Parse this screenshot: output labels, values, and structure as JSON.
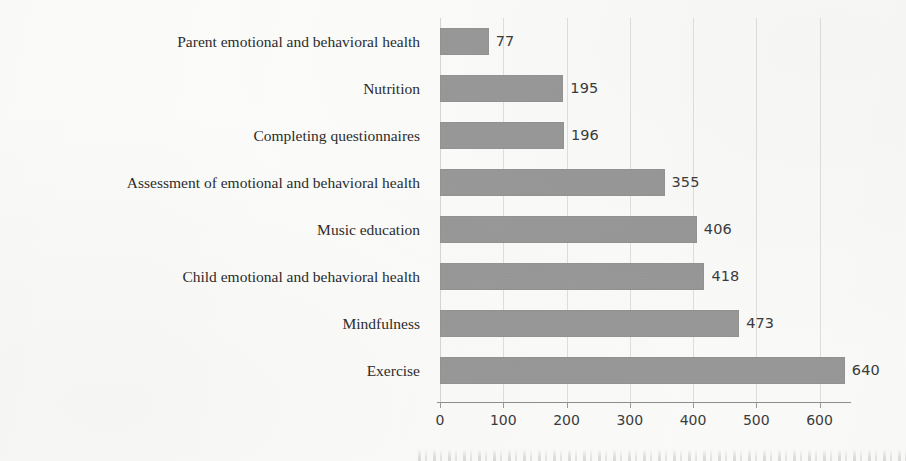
{
  "chart_data": {
    "type": "bar",
    "orientation": "horizontal",
    "title": "",
    "subtitle": "",
    "xlabel": "",
    "ylabel": "",
    "categories": [
      "Parent emotional and behavioral health",
      "Nutrition",
      "Completing questionnaires",
      "Assessment of emotional and behavioral health",
      "Music education",
      "Child emotional and behavioral health",
      "Mindfulness",
      "Exercise"
    ],
    "values": [
      77,
      195,
      196,
      355,
      406,
      418,
      473,
      640
    ],
    "data_labels": [
      "77",
      "195",
      "196",
      "355",
      "406",
      "418",
      "473",
      "640"
    ],
    "xticks": [
      0,
      100,
      200,
      300,
      400,
      500,
      600
    ],
    "xtick_labels": [
      "0",
      "100",
      "200",
      "300",
      "400",
      "500",
      "600"
    ],
    "xlim": [
      0,
      645
    ],
    "grid": "vertical",
    "legend": "none",
    "bar_color": "#989898",
    "text_color": "#2c2c2c",
    "background_color": "#fbfbfa",
    "gridline_color": "#d9d9d6",
    "axis_color": "#8e8e8e"
  }
}
